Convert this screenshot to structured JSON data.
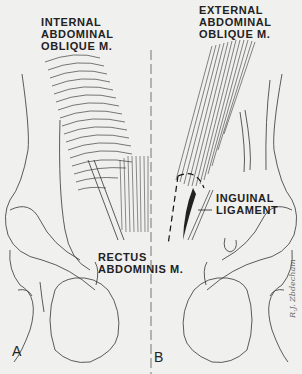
{
  "figure": {
    "panels": [
      {
        "id": "A",
        "label": "A",
        "title": "INTERNAL ABDOMINAL OBLIQUE M."
      },
      {
        "id": "B",
        "label": "B",
        "title": "EXTERNAL ABDOMINAL OBLIQUE M."
      }
    ],
    "labels": {
      "internal_oblique": [
        "INTERNAL",
        "ABDOMINAL",
        "OBLIQUE M."
      ],
      "external_oblique": [
        "EXTERNAL",
        "ABDOMINAL",
        "OBLIQUE M."
      ],
      "inguinal_ligament": [
        "INGUINAL",
        "LIGAMENT"
      ],
      "rectus_abdominis": [
        "RECTUS",
        "ABDOMINIS M."
      ]
    },
    "panel_a_letter": "A",
    "panel_b_letter": "B",
    "signature": "R.J. Zbdecham"
  }
}
